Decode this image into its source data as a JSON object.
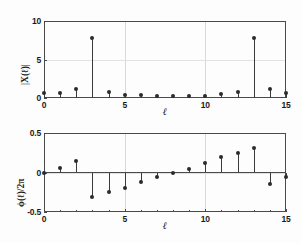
{
  "figure": {
    "background_color": "#fdfdfd",
    "axes_color": "#4a4a4a",
    "marker_color": "#2b2b2b",
    "grid_color": "#d8d8d8"
  },
  "chart_data": [
    {
      "type": "line",
      "plot_style": "stem",
      "panel": "top",
      "title": "",
      "xlabel": "ℓ",
      "ylabel": "|X(ℓ)|",
      "xlim": [
        0,
        15
      ],
      "ylim": [
        0,
        10
      ],
      "xticks": [
        0,
        5,
        10,
        15
      ],
      "xticklabels": [
        "0",
        "5",
        "10",
        "15"
      ],
      "yticks": [
        0,
        5,
        10
      ],
      "yticklabels": [
        "0",
        "5",
        "10"
      ],
      "grid": true,
      "legend": null,
      "x": [
        0,
        1,
        2,
        3,
        4,
        5,
        6,
        7,
        8,
        9,
        10,
        11,
        12,
        13,
        14,
        15
      ],
      "values": [
        0.6,
        0.62,
        1.2,
        7.8,
        0.78,
        0.42,
        0.35,
        0.3,
        0.3,
        0.3,
        0.32,
        0.5,
        0.78,
        7.8,
        1.2,
        0.6
      ]
    },
    {
      "type": "line",
      "plot_style": "stem",
      "panel": "bottom",
      "title": "",
      "xlabel": "ℓ",
      "ylabel": "ϕ(ℓ)/2π",
      "xlim": [
        0,
        15
      ],
      "ylim": [
        -0.5,
        0.5
      ],
      "xticks": [
        0,
        5,
        10,
        15
      ],
      "xticklabels": [
        "0",
        "5",
        "10",
        "15"
      ],
      "yticks": [
        -0.5,
        0,
        0.5
      ],
      "yticklabels": [
        "-0.5",
        "0",
        "0.5"
      ],
      "grid": true,
      "legend": null,
      "x": [
        0,
        1,
        2,
        3,
        4,
        5,
        6,
        7,
        8,
        9,
        10,
        11,
        12,
        13,
        14,
        15
      ],
      "values": [
        0.0,
        0.06,
        0.14,
        -0.31,
        -0.25,
        -0.19,
        -0.12,
        -0.06,
        -0.01,
        0.05,
        0.12,
        0.19,
        0.25,
        0.31,
        -0.14,
        -0.06
      ]
    }
  ]
}
